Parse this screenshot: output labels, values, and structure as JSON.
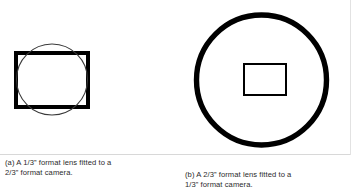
{
  "figure": {
    "background_color": "#ffffff",
    "stroke_color": "#000000",
    "panels": [
      {
        "id": "a",
        "label": "(a)",
        "caption": "(a) A 1/3” format lens fitted to a\n2/3” format camera.",
        "caption_line_1": "(a) A 1/3” format lens fitted to a",
        "caption_line_2": "2/3” format camera.",
        "lens_format": "1/3”",
        "camera_format": "2/3”",
        "shapes": {
          "sensor_rectangle": {
            "role": "camera-sensor",
            "x": 16,
            "y": 53,
            "width": 72,
            "height": 54,
            "stroke_width": 4.6,
            "fill": "none",
            "stroke": "#000000"
          },
          "image_circle": {
            "role": "lens-image-circle",
            "cx": 52,
            "cy": 79.5,
            "r": 35.5,
            "stroke_width": 1.1,
            "fill": "none",
            "stroke": "#3a3a3a"
          }
        }
      },
      {
        "id": "b",
        "label": "(b)",
        "caption": "(b) A 2/3” format lens fitted to a\n1/3” format camera.",
        "caption_line_1": "(b) A 2/3” format lens fitted to a",
        "caption_line_2": "1/3” format camera.",
        "lens_format": "2/3”",
        "camera_format": "1/3”",
        "shapes": {
          "image_circle": {
            "role": "lens-image-circle",
            "cx": 85.5,
            "cy": 80,
            "r": 65,
            "stroke_width": 5.4,
            "fill": "none",
            "stroke": "#000000"
          },
          "sensor_rectangle": {
            "role": "camera-sensor",
            "x": 68,
            "y": 64,
            "width": 42,
            "height": 31,
            "stroke_width": 1.6,
            "fill": "none",
            "stroke": "#000000"
          }
        }
      }
    ]
  }
}
